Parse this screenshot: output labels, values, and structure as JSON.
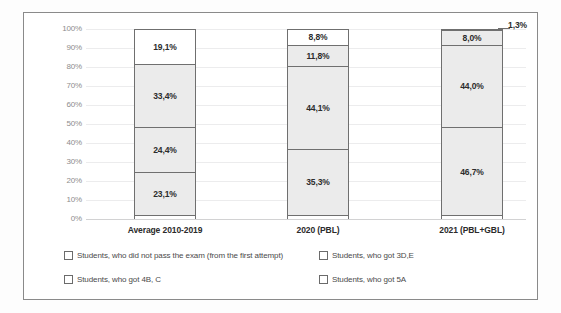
{
  "chart_data": {
    "type": "bar",
    "subtype": "stacked-100-percent",
    "title": "",
    "xlabel": "",
    "ylabel": "",
    "ylim": [
      0,
      100
    ],
    "ytick_labels": [
      "100%",
      "90%",
      "80%",
      "70%",
      "60%",
      "50%",
      "40%",
      "30%",
      "20%",
      "10%",
      "0%"
    ],
    "ytick_values": [
      100,
      90,
      80,
      70,
      60,
      50,
      40,
      30,
      20,
      10,
      0
    ],
    "grid": true,
    "legend_position": "bottom",
    "categories": [
      "Average 2010-2019",
      "2020 (PBL)",
      "2021 (PBL+GBL)"
    ],
    "series": [
      {
        "name": "Students, who did not pass the exam (from the first attempt)",
        "values": [
          23.1,
          35.3,
          46.7
        ],
        "labels": [
          "23,1%",
          "35,3%",
          "46,7%"
        ],
        "fill": "#ebebeb"
      },
      {
        "name": "Students, who got 3D,E",
        "values": [
          24.4,
          44.1,
          44.0
        ],
        "labels": [
          "24,4%",
          "44,1%",
          "44,0%"
        ],
        "fill": "#ebebeb"
      },
      {
        "name": "Students, who got 4B, C",
        "values": [
          33.4,
          11.8,
          8.0
        ],
        "labels": [
          "33,4%",
          "11,8%",
          "8,0%"
        ],
        "fill": "#ebebeb"
      },
      {
        "name": "Students, who got 5A",
        "values": [
          19.1,
          8.8,
          1.3
        ],
        "labels": [
          "19,1%",
          "8,8%",
          "1,3%"
        ],
        "fill": "#ffffff"
      }
    ]
  },
  "axis": {
    "ticks": [
      {
        "label": "100%"
      },
      {
        "label": "90%"
      },
      {
        "label": "80%"
      },
      {
        "label": "70%"
      },
      {
        "label": "60%"
      },
      {
        "label": "50%"
      },
      {
        "label": "40%"
      },
      {
        "label": "30%"
      },
      {
        "label": "20%"
      },
      {
        "label": "10%"
      },
      {
        "label": "0%"
      }
    ]
  },
  "bars": [
    {
      "category": "Average 2010-2019",
      "segments": [
        {
          "label": "19,1%",
          "value": 19.1,
          "fill": "white",
          "outside": false
        },
        {
          "label": "33,4%",
          "value": 33.4,
          "fill": "gray",
          "outside": false
        },
        {
          "label": "24,4%",
          "value": 24.4,
          "fill": "gray",
          "outside": false
        },
        {
          "label": "23,1%",
          "value": 23.1,
          "fill": "gray",
          "outside": false
        }
      ]
    },
    {
      "category": "2020 (PBL)",
      "segments": [
        {
          "label": "8,8%",
          "value": 8.8,
          "fill": "white",
          "outside": false
        },
        {
          "label": "11,8%",
          "value": 11.8,
          "fill": "gray",
          "outside": false
        },
        {
          "label": "44,1%",
          "value": 44.1,
          "fill": "gray",
          "outside": false
        },
        {
          "label": "35,3%",
          "value": 35.3,
          "fill": "gray",
          "outside": false
        }
      ]
    },
    {
      "category": "2021 (PBL+GBL)",
      "segments": [
        {
          "label": "1,3%",
          "value": 1.3,
          "fill": "white",
          "outside": true
        },
        {
          "label": "8,0%",
          "value": 8.0,
          "fill": "gray",
          "outside": false
        },
        {
          "label": "44,0%",
          "value": 44.0,
          "fill": "gray",
          "outside": false
        },
        {
          "label": "46,7%",
          "value": 46.7,
          "fill": "gray",
          "outside": false
        }
      ]
    }
  ],
  "legend": {
    "items": [
      {
        "label": "Students, who did not pass the exam (from the first attempt)"
      },
      {
        "label": "Students, who got 3D,E"
      },
      {
        "label": "Students, who got 4B, C"
      },
      {
        "label": "Students, who got 5A"
      }
    ]
  },
  "colors": {
    "segment_gray": "#ebebeb",
    "segment_white": "#ffffff",
    "segment_border": "#6f6f6f",
    "gridline": "#ececed",
    "frame": "#8a8a8a",
    "tick_text": "#8d8d8d",
    "label_text": "#2c2c2c"
  }
}
